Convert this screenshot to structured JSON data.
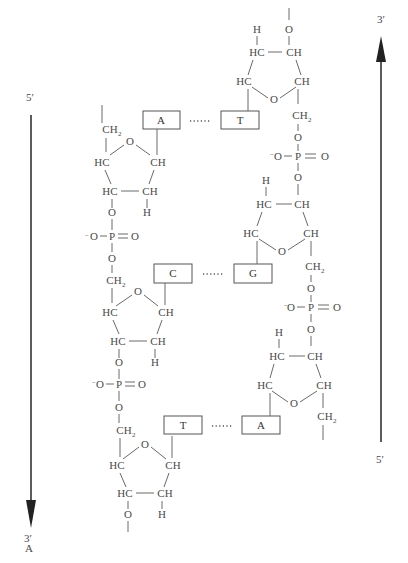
{
  "figure": {
    "label": "A",
    "left_strand": {
      "top_label": "5′",
      "bottom_label": "3′",
      "direction": "down"
    },
    "right_strand": {
      "top_label": "3′",
      "bottom_label": "5′",
      "direction": "up"
    }
  },
  "base_pairs": [
    {
      "left": "A",
      "right": "T",
      "bond": "·····"
    },
    {
      "left": "C",
      "right": "G",
      "bond": "·····"
    },
    {
      "left": "T",
      "right": "A",
      "bond": "·····"
    }
  ],
  "atoms": {
    "O": "O",
    "HC": "HC",
    "CH": "CH",
    "H": "H",
    "CH2": "CH",
    "sub2": "2",
    "P": "P",
    "O_minus": "O",
    "minus": "−",
    "eq_O": "O"
  }
}
